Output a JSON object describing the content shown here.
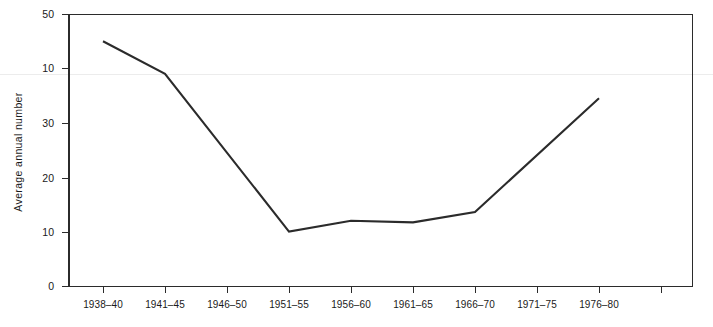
{
  "chart_data": {
    "type": "line",
    "title": "",
    "xlabel": "",
    "ylabel": "Average annual number",
    "categories": [
      "1938–40",
      "1941–45",
      "1946–50",
      "1951–55",
      "1956–60",
      "1961–65",
      "1966–70",
      "1971–75",
      "1976–80"
    ],
    "values": [
      45,
      39,
      null,
      10,
      12,
      11.7,
      13.6,
      null,
      34.5
    ],
    "series": [
      {
        "name": "Average annual number",
        "points": [
          {
            "category": "1938–40",
            "value": 45
          },
          {
            "category": "1941–45",
            "value": 39
          },
          {
            "category": "1951–55",
            "value": 10
          },
          {
            "category": "1956–60",
            "value": 12
          },
          {
            "category": "1961–65",
            "value": 11.7
          },
          {
            "category": "1966–70",
            "value": 13.6
          },
          {
            "category": "1976–80",
            "value": 34.5
          }
        ]
      }
    ],
    "ylim": [
      0,
      50
    ],
    "ytick_values": [
      0,
      10,
      20,
      30,
      40,
      50
    ],
    "ytick_labels": [
      "0",
      "10",
      "20",
      "30",
      "10",
      "50"
    ],
    "grid": false,
    "legend": false,
    "legend_position": "none"
  },
  "axes": {
    "y_title": "Average annual number",
    "y_ticks": [
      {
        "label": "50",
        "value": 50
      },
      {
        "label": "10",
        "value": 40
      },
      {
        "label": "30",
        "value": 30
      },
      {
        "label": "20",
        "value": 20
      },
      {
        "label": "10",
        "value": 10
      },
      {
        "label": "0",
        "value": 0
      }
    ],
    "x_ticks": [
      {
        "label": "1938–40"
      },
      {
        "label": "1941–45"
      },
      {
        "label": "1946–50"
      },
      {
        "label": "1951–55"
      },
      {
        "label": "1956–60"
      },
      {
        "label": "1961–65"
      },
      {
        "label": "1966–70"
      },
      {
        "label": "1971–75"
      },
      {
        "label": "1976–80"
      },
      {
        "label": ""
      }
    ]
  },
  "artifacts": {
    "clipped_caption": "ʔ"
  },
  "colors": {
    "line": "#2b2b2b",
    "axis": "#2b2b2b",
    "text": "#1a1a1a",
    "background": "#ffffff",
    "scan_streak": "#ececec"
  }
}
